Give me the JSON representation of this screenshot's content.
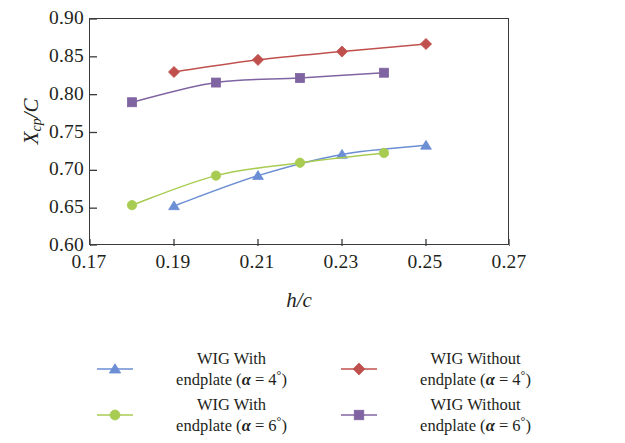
{
  "chart_data": {
    "type": "line",
    "title": "",
    "xlabel": "h/c",
    "ylabel": "Xcp/C",
    "xlim": [
      0.17,
      0.27
    ],
    "ylim": [
      0.6,
      0.9
    ],
    "grid": false,
    "legend_position": "bottom",
    "x_ticks": [
      "0.17",
      "0.19",
      "0.21",
      "0.23",
      "0.25",
      "0.27"
    ],
    "x_tick_values": [
      0.17,
      0.19,
      0.21,
      0.23,
      0.25,
      0.27
    ],
    "y_ticks": [
      "0.60",
      "0.65",
      "0.70",
      "0.75",
      "0.80",
      "0.85",
      "0.90"
    ],
    "y_tick_values": [
      0.6,
      0.65,
      0.7,
      0.75,
      0.8,
      0.85,
      0.9
    ],
    "series": [
      {
        "name": "WIG With endplate (α = 4°)",
        "marker": "triangle",
        "color": "#6b8ed4",
        "x": [
          0.19,
          0.21,
          0.23,
          0.25
        ],
        "values": [
          0.653,
          0.693,
          0.721,
          0.733
        ]
      },
      {
        "name": "WIG With endplate (α = 6°)",
        "marker": "circle",
        "color": "#a8cc52",
        "x": [
          0.18,
          0.2,
          0.22,
          0.24
        ],
        "values": [
          0.654,
          0.693,
          0.71,
          0.723
        ]
      },
      {
        "name": "WIG Without endplate (α = 4°)",
        "marker": "diamond",
        "color": "#c0504d",
        "x": [
          0.19,
          0.21,
          0.23,
          0.25
        ],
        "values": [
          0.83,
          0.846,
          0.857,
          0.867
        ]
      },
      {
        "name": "WIG Without endplate (α = 6°)",
        "marker": "square",
        "color": "#8064a2",
        "x": [
          0.18,
          0.2,
          0.22,
          0.24
        ],
        "values": [
          0.79,
          0.816,
          0.822,
          0.829
        ]
      }
    ]
  },
  "axes": {
    "y_title_main": "X",
    "y_title_sub": "cp",
    "y_title_tail": "/C",
    "x_title": "h/c"
  },
  "legend": {
    "entries": [
      {
        "line1": "WIG With",
        "line2_pre": "endplate (",
        "alpha": "α",
        "eq": " = 4",
        "deg": "°",
        "close": ")",
        "marker": "triangle",
        "color": "#6b8ed4"
      },
      {
        "line1": "WIG Without",
        "line2_pre": "endplate (",
        "alpha": "α",
        "eq": " = 4",
        "deg": "°",
        "close": ")",
        "marker": "diamond",
        "color": "#c0504d"
      },
      {
        "line1": "WIG With",
        "line2_pre": "endplate (",
        "alpha": "α",
        "eq": " = 6",
        "deg": "°",
        "close": ")",
        "marker": "circle",
        "color": "#a8cc52"
      },
      {
        "line1": "WIG Without",
        "line2_pre": "endplate (",
        "alpha": "α",
        "eq": " = 6",
        "deg": "°",
        "close": ")",
        "marker": "square",
        "color": "#8064a2"
      }
    ]
  }
}
